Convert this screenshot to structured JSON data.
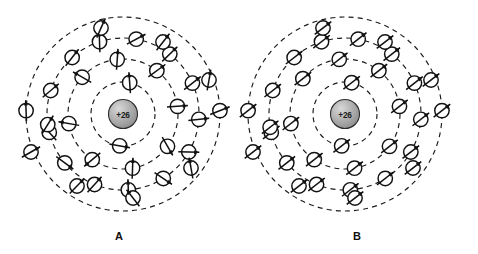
{
  "figure": {
    "background_color": "#ffffff",
    "width": 478,
    "height": 254
  },
  "colors": {
    "ink": "#111111",
    "ring_stroke": "#1a1a1a",
    "nucleus_fill_light": "#d8d8d8",
    "nucleus_fill_dark": "#8f8f8f",
    "nucleus_stroke": "#2b2b2b",
    "electron_fill": "#ffffff",
    "background": "#ffffff"
  },
  "panels": [
    {
      "id": "panel-a",
      "label": "A",
      "label_x": 119,
      "label_y": 240,
      "center_x": 123,
      "center_y": 114,
      "spin_state": "unaligned",
      "nucleus": {
        "label": "+26",
        "radius": 14.5,
        "element": "iron"
      },
      "shells": [
        {
          "index": 1,
          "radius": 32,
          "electron_count": 2
        },
        {
          "index": 2,
          "radius": 55,
          "electron_count": 8
        },
        {
          "index": 3,
          "radius": 76,
          "electron_count": 14
        },
        {
          "index": 4,
          "radius": 97,
          "electron_count": 2
        }
      ],
      "electrons": [
        {
          "shell": 1,
          "angle": -78,
          "spin_angle": -94
        },
        {
          "shell": 1,
          "angle": 96,
          "spin_angle": 10
        },
        {
          "shell": 2,
          "angle": -138,
          "spin_angle": -150
        },
        {
          "shell": 2,
          "angle": -96,
          "spin_angle": -86
        },
        {
          "shell": 2,
          "angle": -52,
          "spin_angle": -36
        },
        {
          "shell": 2,
          "angle": -8,
          "spin_angle": -4
        },
        {
          "shell": 2,
          "angle": 36,
          "spin_angle": 60
        },
        {
          "shell": 2,
          "angle": 80,
          "spin_angle": -88
        },
        {
          "shell": 2,
          "angle": 124,
          "spin_angle": 140
        },
        {
          "shell": 2,
          "angle": 170,
          "spin_angle": -170
        },
        {
          "shell": 3,
          "angle": -162,
          "spin_angle": -40
        },
        {
          "shell": 3,
          "angle": -132,
          "spin_angle": -52
        },
        {
          "shell": 3,
          "angle": -108,
          "spin_angle": -92
        },
        {
          "shell": 3,
          "angle": -80,
          "spin_angle": -28
        },
        {
          "shell": 3,
          "angle": -52,
          "spin_angle": -44
        },
        {
          "shell": 3,
          "angle": -24,
          "spin_angle": -38
        },
        {
          "shell": 3,
          "angle": 4,
          "spin_angle": -6
        },
        {
          "shell": 3,
          "angle": 30,
          "spin_angle": 2
        },
        {
          "shell": 3,
          "angle": 58,
          "spin_angle": 34
        },
        {
          "shell": 3,
          "angle": 86,
          "spin_angle": -92
        },
        {
          "shell": 3,
          "angle": 112,
          "spin_angle": -48
        },
        {
          "shell": 3,
          "angle": 140,
          "spin_angle": 36
        },
        {
          "shell": 3,
          "angle": 166,
          "spin_angle": -132
        },
        {
          "shell": 3,
          "angle": -188,
          "spin_angle": -58
        },
        {
          "shell": 4,
          "angle": -178,
          "spin_angle": -92
        },
        {
          "shell": 4,
          "angle": -2,
          "spin_angle": -22
        }
      ],
      "extra_electrons": [
        {
          "x": -92,
          "y": 38,
          "spin_angle": -30
        },
        {
          "x": 86,
          "y": -34,
          "spin_angle": -80
        },
        {
          "x": 68,
          "y": 54,
          "spin_angle": -100
        },
        {
          "x": -46,
          "y": 72,
          "spin_angle": -46
        },
        {
          "x": 10,
          "y": 84,
          "spin_angle": -128
        },
        {
          "x": -22,
          "y": -86,
          "spin_angle": -66
        },
        {
          "x": 40,
          "y": -72,
          "spin_angle": -52
        }
      ]
    },
    {
      "id": "panel-b",
      "label": "B",
      "label_x": 118,
      "label_y": 240,
      "center_x": 106,
      "center_y": 114,
      "spin_state": "aligned",
      "uniform_spin_angle": -38,
      "nucleus": {
        "label": "+26",
        "radius": 14.5,
        "element": "iron"
      },
      "shells": [
        {
          "index": 1,
          "radius": 32,
          "electron_count": 2
        },
        {
          "index": 2,
          "radius": 55,
          "electron_count": 8
        },
        {
          "index": 3,
          "radius": 76,
          "electron_count": 14
        },
        {
          "index": 4,
          "radius": 97,
          "electron_count": 2
        }
      ],
      "electrons": [
        {
          "shell": 1,
          "angle": -78,
          "spin_angle": -38
        },
        {
          "shell": 1,
          "angle": 96,
          "spin_angle": -38
        },
        {
          "shell": 2,
          "angle": -140,
          "spin_angle": -38
        },
        {
          "shell": 2,
          "angle": -96,
          "spin_angle": -38
        },
        {
          "shell": 2,
          "angle": -52,
          "spin_angle": -38
        },
        {
          "shell": 2,
          "angle": -8,
          "spin_angle": -38
        },
        {
          "shell": 2,
          "angle": 36,
          "spin_angle": -38
        },
        {
          "shell": 2,
          "angle": 80,
          "spin_angle": -38
        },
        {
          "shell": 2,
          "angle": 124,
          "spin_angle": -38
        },
        {
          "shell": 2,
          "angle": 170,
          "spin_angle": -38
        },
        {
          "shell": 3,
          "angle": -162,
          "spin_angle": -38
        },
        {
          "shell": 3,
          "angle": -132,
          "spin_angle": -38
        },
        {
          "shell": 3,
          "angle": -108,
          "spin_angle": -38
        },
        {
          "shell": 3,
          "angle": -80,
          "spin_angle": -38
        },
        {
          "shell": 3,
          "angle": -52,
          "spin_angle": -38
        },
        {
          "shell": 3,
          "angle": -24,
          "spin_angle": -38
        },
        {
          "shell": 3,
          "angle": 4,
          "spin_angle": -38
        },
        {
          "shell": 3,
          "angle": 30,
          "spin_angle": -38
        },
        {
          "shell": 3,
          "angle": 58,
          "spin_angle": -38
        },
        {
          "shell": 3,
          "angle": 86,
          "spin_angle": -38
        },
        {
          "shell": 3,
          "angle": 112,
          "spin_angle": -38
        },
        {
          "shell": 3,
          "angle": 140,
          "spin_angle": -38
        },
        {
          "shell": 3,
          "angle": 166,
          "spin_angle": -38
        },
        {
          "shell": 3,
          "angle": -190,
          "spin_angle": -38
        },
        {
          "shell": 4,
          "angle": -178,
          "spin_angle": -38
        },
        {
          "shell": 4,
          "angle": -2,
          "spin_angle": -38
        }
      ],
      "extra_electrons": [
        {
          "x": -92,
          "y": 38,
          "spin_angle": -38
        },
        {
          "x": 86,
          "y": -34,
          "spin_angle": -38
        },
        {
          "x": 68,
          "y": 54,
          "spin_angle": -38
        },
        {
          "x": -46,
          "y": 72,
          "spin_angle": -38
        },
        {
          "x": 10,
          "y": 84,
          "spin_angle": -38
        },
        {
          "x": -22,
          "y": -86,
          "spin_angle": -38
        },
        {
          "x": 40,
          "y": -72,
          "spin_angle": -38
        }
      ]
    }
  ],
  "geometry": {
    "electron_radius": 7.2,
    "spin_length": 21,
    "arrow_head_length": 5.2,
    "arrow_head_width": 4.0
  }
}
